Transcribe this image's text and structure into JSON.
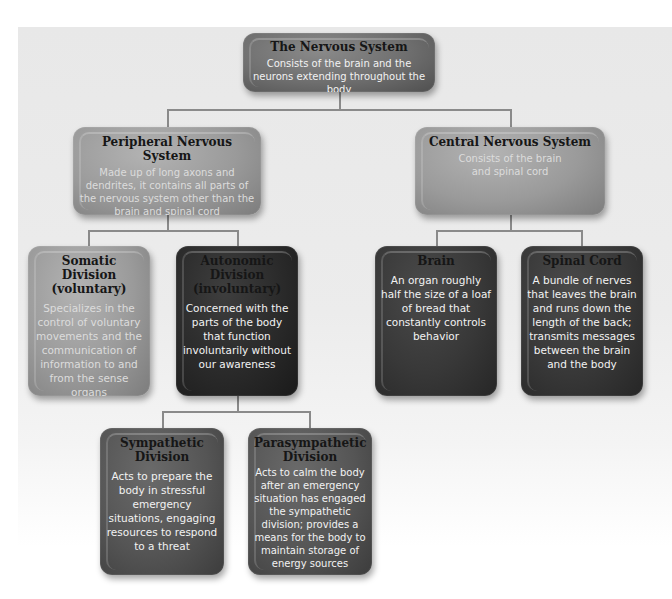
{
  "diagram": {
    "root": {
      "title": "The Nervous System",
      "description": "Consists of the brain and the neurons extending throughout the body"
    },
    "peripheral": {
      "title": "Peripheral Nervous System",
      "description": "Made up of long axons and dendrites, it contains all parts of the nervous system other than the brain and spinal cord"
    },
    "central": {
      "title": "Central Nervous System",
      "description": "Consists of the brain and spinal cord"
    },
    "somatic": {
      "title": "Somatic Division (voluntary)",
      "description": "Specializes in the control of voluntary movements and the communication of information to and from the sense organs"
    },
    "autonomic": {
      "title": "Autonomic Division (involuntary)",
      "description": "Concerned with the parts of the body that function involuntarily without our awareness"
    },
    "brain": {
      "title": "Brain",
      "description": "An organ roughly half the size of a loaf of bread that constantly controls behavior"
    },
    "spinal_cord": {
      "title": "Spinal Cord",
      "description": "A bundle of nerves that leaves the brain and runs down the length of the back; transmits messages between the brain and the body"
    },
    "sympathetic": {
      "title": "Sympathetic Division",
      "description": "Acts to prepare the body in stressful emergency situations, engaging resources to respond to a threat"
    },
    "parasympathetic": {
      "title": "Parasympathetic Division",
      "description": "Acts to calm the body after an emergency situation has engaged the sympathetic division; provides a means for the body to maintain storage of energy sources"
    }
  }
}
